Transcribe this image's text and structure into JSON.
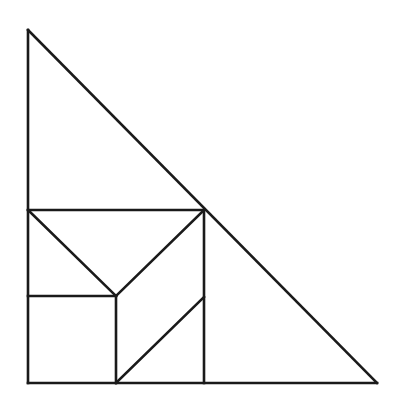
{
  "figure": {
    "label_fragment": ")",
    "stroke_color": "#1a1a1a",
    "stroke_width": 2.6,
    "background": "#ffffff"
  },
  "diagram": {
    "outer_triangle": {
      "top": [
        28,
        30
      ],
      "bottom_left": [
        28,
        383
      ],
      "bottom_right": [
        377,
        383
      ]
    },
    "segments": [
      {
        "name": "outer-left-edge",
        "from": [
          28,
          30
        ],
        "to": [
          28,
          383
        ]
      },
      {
        "name": "outer-bottom-edge",
        "from": [
          28,
          383
        ],
        "to": [
          377,
          383
        ]
      },
      {
        "name": "outer-hypotenuse",
        "from": [
          28,
          30
        ],
        "to": [
          377,
          383
        ]
      },
      {
        "name": "upper-horizontal",
        "from": [
          28,
          210
        ],
        "to": [
          204,
          210
        ]
      },
      {
        "name": "right-vertical",
        "from": [
          204,
          210
        ],
        "to": [
          204,
          383
        ]
      },
      {
        "name": "left-diagonal-to-center",
        "from": [
          28,
          210
        ],
        "to": [
          116,
          296
        ]
      },
      {
        "name": "right-diagonal-to-center",
        "from": [
          204,
          210
        ],
        "to": [
          116,
          296
        ]
      },
      {
        "name": "middle-horizontal",
        "from": [
          28,
          296
        ],
        "to": [
          116,
          296
        ]
      },
      {
        "name": "center-vertical",
        "from": [
          116,
          296
        ],
        "to": [
          116,
          383
        ]
      },
      {
        "name": "lower-diagonal",
        "from": [
          116,
          383
        ],
        "to": [
          204,
          297
        ]
      }
    ]
  }
}
